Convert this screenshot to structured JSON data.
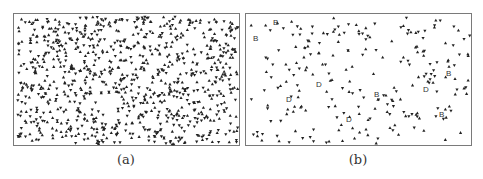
{
  "figure": {
    "panels": [
      {
        "id": "a",
        "caption": "(a)",
        "description": "Dense random field of small up/down triangle markers",
        "marker_color": "#222222",
        "approx_marker_count": 900,
        "letter_labels": []
      },
      {
        "id": "b",
        "caption": "(b)",
        "description": "Sparse field of small up/down triangle markers with letter annotations",
        "marker_color": "#222222",
        "approx_marker_count": 230,
        "letter_labels": [
          {
            "text": "B",
            "x": 27,
            "y": 11
          },
          {
            "text": "B",
            "x": 7,
            "y": 27
          },
          {
            "text": "D",
            "x": 70,
            "y": 73
          },
          {
            "text": "D",
            "x": 40,
            "y": 88
          },
          {
            "text": "B",
            "x": 128,
            "y": 83
          },
          {
            "text": "D",
            "x": 100,
            "y": 108
          },
          {
            "text": "D",
            "x": 177,
            "y": 78
          },
          {
            "text": "B",
            "x": 200,
            "y": 62
          },
          {
            "text": "B",
            "x": 193,
            "y": 103
          }
        ]
      }
    ],
    "border_color": "#7a7a7a"
  }
}
